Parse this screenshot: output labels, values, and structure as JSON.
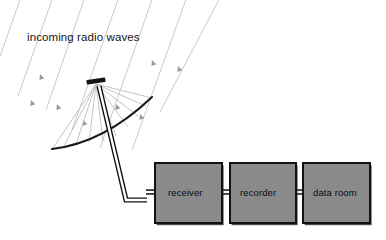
{
  "figure": {
    "background_color": "#ffffff",
    "width": 386,
    "height": 240
  },
  "annotations": {
    "wave_label": "incoming radio waves"
  },
  "colors": {
    "box_fill": "#8a8a8a",
    "box_stroke": "#111111",
    "wave_line": "#c9c9c9",
    "arrowhead": "#9a9a9a",
    "ray_line": "#bdbdbd",
    "dish_stroke": "#1a1a1a",
    "mast_stroke": "#111111",
    "mast_fill": "#ffffff",
    "text": "#111111"
  },
  "boxes": [
    {
      "id": "receiver",
      "label": "receiver",
      "x": 155,
      "y": 163,
      "w": 67,
      "h": 60
    },
    {
      "id": "recorder",
      "label": "recorder",
      "x": 230,
      "y": 163,
      "w": 66,
      "h": 60
    },
    {
      "id": "data-room",
      "label": "data room",
      "x": 303,
      "y": 163,
      "w": 67,
      "h": 60
    }
  ],
  "connectors": [
    {
      "from": "mast",
      "to": "receiver",
      "x1": 146,
      "x2": 156,
      "y": 192
    },
    {
      "from": "receiver",
      "to": "recorder",
      "x1": 221,
      "x2": 231,
      "y": 192
    },
    {
      "from": "recorder",
      "to": "data-room",
      "x1": 295,
      "x2": 304,
      "y": 192
    }
  ],
  "dish": {
    "focus_x": 96,
    "focus_y": 84,
    "arc": "M 52 149 Q 104 143 152 97",
    "feed_horn": {
      "cx": 96,
      "cy": 81,
      "w": 19,
      "h": 4.5,
      "rotation_deg": -8
    }
  },
  "mast": {
    "path": "M 99 86 L 126 200 L 147 200",
    "elbow_x": 126,
    "elbow_y": 200
  },
  "incoming_waves": {
    "count": 7,
    "direction_deg": 250,
    "lines": [
      {
        "x1": 22,
        "y1": -6,
        "x2": -14,
        "y2": 96
      },
      {
        "x1": 54,
        "y1": -6,
        "x2": 18,
        "y2": 96
      },
      {
        "x1": 86,
        "y1": -6,
        "x2": 46,
        "y2": 110
      },
      {
        "x1": 120,
        "y1": -6,
        "x2": 72,
        "y2": 130
      },
      {
        "x1": 154,
        "y1": -6,
        "x2": 100,
        "y2": 148
      },
      {
        "x1": 188,
        "y1": -6,
        "x2": 132,
        "y2": 150
      },
      {
        "x1": 222,
        "y1": -6,
        "x2": 160,
        "y2": 112
      }
    ],
    "arrowheads": [
      {
        "x": 40,
        "y": 74,
        "angle": 250
      },
      {
        "x": 31,
        "y": 100,
        "angle": 250
      },
      {
        "x": 57,
        "y": 104,
        "angle": 250
      },
      {
        "x": 83,
        "y": 120,
        "angle": 250
      },
      {
        "x": 116,
        "y": 104,
        "angle": 250
      },
      {
        "x": 140,
        "y": 114,
        "angle": 250
      },
      {
        "x": 152,
        "y": 60,
        "angle": 250
      },
      {
        "x": 178,
        "y": 66,
        "angle": 250
      }
    ]
  },
  "reflected_rays": {
    "description": "rays converging from dish surface to feed horn focus",
    "targets": [
      {
        "x": 53,
        "y": 148
      },
      {
        "x": 64,
        "y": 146
      },
      {
        "x": 76,
        "y": 144
      },
      {
        "x": 89,
        "y": 142
      },
      {
        "x": 103,
        "y": 141
      },
      {
        "x": 116,
        "y": 136
      },
      {
        "x": 128,
        "y": 127
      },
      {
        "x": 138,
        "y": 116
      },
      {
        "x": 146,
        "y": 106
      },
      {
        "x": 152,
        "y": 98
      }
    ]
  }
}
